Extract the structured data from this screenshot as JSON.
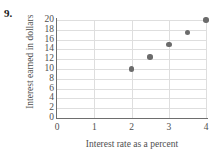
{
  "problem": {
    "number": "9."
  },
  "chart_data": {
    "type": "scatter",
    "title": "",
    "xlabel": "Interest rate as a percent",
    "ylabel": "Interest earned in dollars",
    "xlim": [
      0,
      4
    ],
    "ylim": [
      0,
      20
    ],
    "xticks": [
      "0",
      "1",
      "2",
      "3",
      "4"
    ],
    "xtick_values": [
      0,
      1,
      2,
      3,
      4
    ],
    "yticks": [
      "0",
      "2",
      "4",
      "6",
      "8",
      "10",
      "12",
      "14",
      "16",
      "18",
      "20"
    ],
    "ytick_values": [
      0,
      2,
      4,
      6,
      8,
      10,
      12,
      14,
      16,
      18,
      20
    ],
    "grid": true,
    "legend": "none",
    "point_color": "#6b6b6b",
    "axis_color": "#6e6e6e",
    "grid_color": "#dedede",
    "points": [
      {
        "x": 2,
        "y": 10
      },
      {
        "x": 2.5,
        "y": 12.5
      },
      {
        "x": 3,
        "y": 15
      },
      {
        "x": 3.5,
        "y": 17.5
      },
      {
        "x": 4,
        "y": 20
      }
    ]
  }
}
